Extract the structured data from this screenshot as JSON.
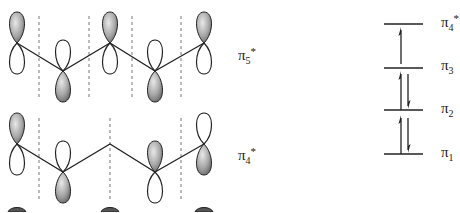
{
  "orbitals": [
    {
      "label_main": "π",
      "label_sub": "5",
      "label_sup": "*",
      "lobes_top_shaded": [
        true,
        false,
        true,
        false,
        true
      ],
      "nodes_x": [
        39,
        89,
        132,
        181
      ]
    },
    {
      "label_main": "π",
      "label_sub": "4",
      "label_sup": "*",
      "lobes_top_shaded": [
        true,
        false,
        null,
        true,
        false
      ],
      "nodes_x": [
        39,
        110,
        181
      ]
    }
  ],
  "energy_levels": [
    {
      "label_main": "π",
      "label_sub": "4",
      "label_sup": "*",
      "electrons": "1 up (excited)"
    },
    {
      "label_main": "π",
      "label_sub": "3",
      "label_sup": "",
      "electrons": "1 up"
    },
    {
      "label_main": "π",
      "label_sub": "2",
      "label_sup": "",
      "electrons": "paired"
    },
    {
      "label_main": "π",
      "label_sub": "1",
      "label_sup": "",
      "electrons": "paired"
    }
  ],
  "colors": {
    "line": "#222222",
    "lobe_shaded": "#9a9a9a",
    "node": "#777777"
  }
}
